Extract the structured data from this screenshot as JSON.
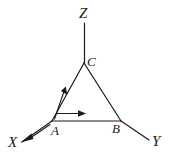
{
  "figure": {
    "background_color": "#ffffff",
    "stroke_color": "#1a1a1a",
    "width": 172,
    "height": 159,
    "axes": [
      {
        "name": "Z",
        "label": "Z",
        "from": "C",
        "direction": "up"
      },
      {
        "name": "X",
        "label": "X",
        "from": "A",
        "direction": "down-left"
      },
      {
        "name": "Y",
        "label": "Y",
        "from": "B",
        "direction": "down-right"
      }
    ],
    "vertices": [
      {
        "name": "C",
        "label": "C",
        "x": 84,
        "y": 63
      },
      {
        "name": "A",
        "label": "A",
        "x": 52,
        "y": 121
      },
      {
        "name": "B",
        "label": "B",
        "x": 121,
        "y": 121
      }
    ],
    "edges": [
      {
        "name": "edge-AC",
        "from": "A",
        "to": "C"
      },
      {
        "name": "edge-CB",
        "from": "C",
        "to": "B"
      },
      {
        "name": "edge-AB",
        "from": "A",
        "to": "B"
      }
    ],
    "vectors": [
      {
        "name": "vector-along-AC",
        "from": "A",
        "to": "C",
        "direction": "toward-C"
      },
      {
        "name": "vector-along-AB",
        "from": "A",
        "to": "B",
        "direction": "toward-B"
      },
      {
        "name": "vector-along-AX",
        "from": "A",
        "to": "X",
        "direction": "toward-X"
      }
    ]
  }
}
